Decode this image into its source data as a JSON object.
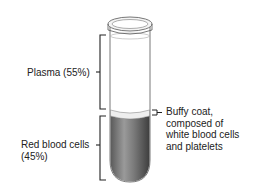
{
  "diagram": {
    "labels": {
      "plasma": "Plasma (55%)",
      "buffy_line1": "Buffy coat,",
      "buffy_line2": "composed of",
      "buffy_line3": "white blood cells",
      "buffy_line4": "and platelets",
      "rbc_line1": "Red blood cells",
      "rbc_line2": "(45%)"
    },
    "colors": {
      "plasma": "#ffffff",
      "red_cells": "#6e6e6e",
      "outline": "#333333"
    }
  }
}
